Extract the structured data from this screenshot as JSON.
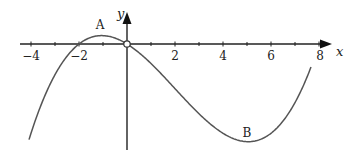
{
  "figure": {
    "x_axis_label": "x",
    "y_axis_label": "y",
    "x_ticks": [
      "−4",
      "−2",
      "2",
      "4",
      "6",
      "8"
    ],
    "point_labels": {
      "max": "A",
      "min": "B"
    }
  },
  "chart_data": {
    "type": "line",
    "title": "",
    "xlabel": "x",
    "ylabel": "y",
    "xlim": [
      -4.5,
      8.5
    ],
    "x_tick_values": [
      -4,
      -3,
      -2,
      -1,
      0,
      1,
      2,
      3,
      4,
      5,
      6,
      7,
      8
    ],
    "x_tick_labels": [
      "−4",
      "−2",
      "2",
      "4",
      "6",
      "8"
    ],
    "grid": false,
    "series": [
      {
        "name": "curve",
        "description": "cubic through roots x=-2, 0, 8 (y = k·x(x+2)(x−8))",
        "roots": [
          -2,
          0,
          8
        ]
      }
    ],
    "annotations": [
      {
        "label": "A",
        "description": "local maximum",
        "x": -1
      },
      {
        "label": "B",
        "description": "local minimum",
        "x": 5
      },
      {
        "label": "origin",
        "description": "open circle at (0,0)",
        "x": 0,
        "y": 0
      }
    ]
  }
}
